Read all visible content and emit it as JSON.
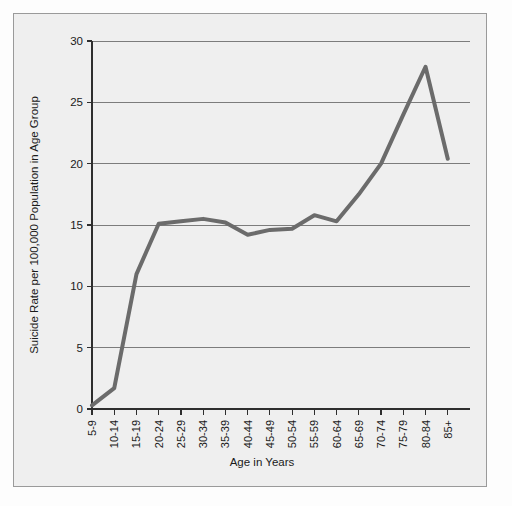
{
  "chart_data": {
    "type": "line",
    "title": "",
    "xlabel": "Age in Years",
    "ylabel": "Suicide Rate per 100,000 Population in Age Group",
    "categories": [
      "5-9",
      "10-14",
      "15-19",
      "20-24",
      "25-29",
      "30-34",
      "35-39",
      "40-44",
      "45-49",
      "50-54",
      "55-59",
      "60-64",
      "65-69",
      "70-74",
      "75-79",
      "80-84",
      "85+"
    ],
    "values": [
      0.3,
      1.7,
      11.0,
      15.1,
      15.3,
      15.5,
      15.2,
      14.2,
      14.6,
      14.7,
      15.8,
      15.3,
      17.5,
      20.0,
      24.0,
      27.9,
      20.4
    ],
    "series": [
      {
        "name": "Suicide rate",
        "values": [
          0.3,
          1.7,
          11.0,
          15.1,
          15.3,
          15.5,
          15.2,
          14.2,
          14.6,
          14.7,
          15.8,
          15.3,
          17.5,
          20.0,
          24.0,
          27.9,
          20.4
        ],
        "color": "#6b6b6b"
      }
    ],
    "ylim": [
      0,
      30
    ],
    "yticks": [
      0,
      5,
      10,
      15,
      20,
      25,
      30
    ],
    "ytick_labels": [
      "0",
      "5",
      "10",
      "15",
      "20",
      "25",
      "30"
    ],
    "grid": true,
    "grid_axis": "y",
    "legend": false,
    "legend_position": "none",
    "xtick_rotation": 90,
    "background_color": "#efefef",
    "line_color": "#6b6b6b",
    "grid_color": "#6f6f6f",
    "axis_color": "#2e2e2e",
    "text_color": "#1a1a1a"
  }
}
